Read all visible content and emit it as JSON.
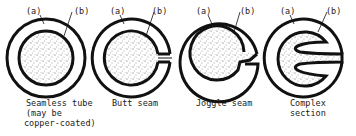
{
  "diagram": {
    "part_labels": {
      "a": "(a)",
      "b": "(b)"
    },
    "sections": [
      {
        "id": "seamless",
        "caption": [
          "Seamless tube",
          "(may be",
          " copper-coated)"
        ]
      },
      {
        "id": "butt",
        "caption": [
          "Butt seam"
        ]
      },
      {
        "id": "joggle",
        "caption": [
          "Joggle seam"
        ]
      },
      {
        "id": "complex",
        "caption": [
          "Complex",
          "section"
        ]
      }
    ],
    "colors": {
      "stroke": "#111111",
      "fill_dots": "#333333",
      "background": "#ffffff"
    }
  }
}
